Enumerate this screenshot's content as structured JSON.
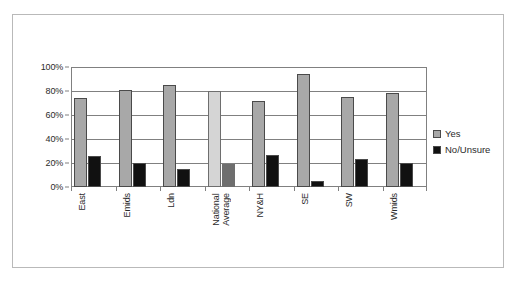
{
  "chart_data": {
    "type": "bar",
    "title": "",
    "xlabel": "",
    "ylabel": "",
    "ylim": [
      0,
      100
    ],
    "ytick_labels": [
      "100%",
      "80%",
      "60%",
      "40%",
      "20%",
      "0%"
    ],
    "ytick_values": [
      100,
      80,
      60,
      40,
      20,
      0
    ],
    "grid": true,
    "legend_position": "right",
    "categories": [
      "East",
      "Emids",
      "Ldn",
      "National\nAverage",
      "NY&H",
      "SE",
      "SW",
      "Wmids"
    ],
    "series": [
      {
        "name": "Yes",
        "color": "#a8a8a8",
        "highlight_color": "#d5d5d5",
        "values": [
          74,
          81,
          85,
          80,
          72,
          94,
          75,
          78
        ]
      },
      {
        "name": "No/Unsure",
        "color": "#111111",
        "highlight_color": "#6e6e6e",
        "values": [
          26,
          20,
          15,
          19,
          27,
          5,
          23,
          20
        ]
      }
    ],
    "highlighted_category_index": 3
  },
  "legend": {
    "items": [
      {
        "label": "Yes",
        "swatch": "#a8a8a8"
      },
      {
        "label": "No/Unsure",
        "swatch": "#111111"
      }
    ]
  }
}
